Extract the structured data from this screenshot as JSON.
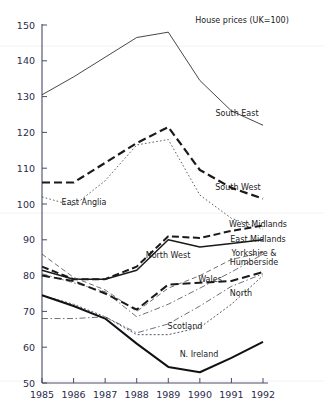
{
  "chart_data": {
    "type": "line",
    "title": "House prices (UK=100)",
    "xlabel": "",
    "ylabel": "",
    "x": [
      1985,
      1986,
      1987,
      1988,
      1989,
      1990,
      1991,
      1992
    ],
    "xticklabels": [
      "1985",
      "1986",
      "1987",
      "1988",
      "1989",
      "1990",
      "1991",
      "1992"
    ],
    "yticklabels": [
      "50",
      "60",
      "70",
      "80",
      "90",
      "100",
      "110",
      "120",
      "130",
      "140",
      "150"
    ],
    "ylim": [
      50,
      150
    ],
    "xlim": [
      1985,
      1992
    ],
    "grid": false,
    "legend_position": "inline-right",
    "series": [
      {
        "name": "South East",
        "label": "South East",
        "style": "solid-thin",
        "color": "#333333",
        "values": [
          130.5,
          135.5,
          141.0,
          146.5,
          148.0,
          134.5,
          126.0,
          122.0
        ]
      },
      {
        "name": "South West",
        "label": "South West",
        "style": "dashed-thick",
        "color": "#1a1a1a",
        "values": [
          106.0,
          106.0,
          111.5,
          117.0,
          121.5,
          109.5,
          104.5,
          101.5
        ]
      },
      {
        "name": "East Anglia",
        "label": "East Anglia",
        "style": "dotted",
        "color": "#444444",
        "values": [
          102.0,
          99.5,
          106.5,
          116.5,
          118.0,
          102.5,
          96.0,
          93.0
        ]
      },
      {
        "name": "West Midlands",
        "label": "West Midlands",
        "style": "dash-thick-med",
        "color": "#1a1a1a",
        "values": [
          82.5,
          79.0,
          79.0,
          82.5,
          91.0,
          90.5,
          92.5,
          94.0
        ]
      },
      {
        "name": "East Midlands",
        "label": "East Midlands",
        "style": "solid-med",
        "color": "#1a1a1a",
        "values": [
          81.5,
          79.0,
          79.0,
          81.5,
          90.0,
          88.0,
          89.0,
          90.0
        ]
      },
      {
        "name": "North West",
        "label": "North West",
        "style": "dashed-fine",
        "color": "#555555",
        "values": [
          86.0,
          79.5,
          76.0,
          70.0,
          76.5,
          80.0,
          84.5,
          86.5
        ]
      },
      {
        "name": "Yorkshire & Humberside",
        "label": "Yorkshire & Humberside",
        "style": "dash-dot",
        "color": "#555566",
        "values": [
          80.5,
          78.0,
          75.5,
          68.5,
          72.0,
          76.5,
          81.0,
          86.0
        ]
      },
      {
        "name": "Wales",
        "label": "Wales",
        "style": "dashed-thick-flat",
        "color": "#1a1a1a",
        "values": [
          80.0,
          78.5,
          75.0,
          70.5,
          77.5,
          78.0,
          78.5,
          81.0
        ]
      },
      {
        "name": "North",
        "label": "North",
        "style": "dash-dot-fine",
        "color": "#555566",
        "values": [
          68.0,
          68.0,
          68.5,
          64.0,
          66.5,
          71.5,
          77.0,
          80.5
        ]
      },
      {
        "name": "Scotland",
        "label": "Scotland",
        "style": "dotted-fine",
        "color": "#444455",
        "values": [
          74.5,
          72.0,
          68.5,
          63.5,
          63.5,
          65.5,
          72.0,
          80.0
        ]
      },
      {
        "name": "N. Ireland",
        "label": "N. Ireland",
        "style": "solid-thick",
        "color": "#111111",
        "values": [
          74.5,
          71.5,
          68.0,
          61.0,
          54.5,
          53.0,
          57.0,
          61.5
        ]
      }
    ],
    "annotations": [
      {
        "text": "South East",
        "x": 237,
        "y": 116
      },
      {
        "text": "South West",
        "x": 238,
        "y": 190
      },
      {
        "text": "East Anglia",
        "x": 84,
        "y": 205
      },
      {
        "text": "West Midlands",
        "x": 258,
        "y": 227
      },
      {
        "text": "East Midlands",
        "x": 258,
        "y": 242
      },
      {
        "text": "Yorkshire &",
        "x": 254,
        "y": 256
      },
      {
        "text": "Humberside",
        "x": 254,
        "y": 265
      },
      {
        "text": "North West",
        "x": 168,
        "y": 258
      },
      {
        "text": "Wales",
        "x": 210,
        "y": 282
      },
      {
        "text": "North",
        "x": 241,
        "y": 296
      },
      {
        "text": "Scotland",
        "x": 185,
        "y": 329
      },
      {
        "text": "N. Ireland",
        "x": 199,
        "y": 357
      }
    ]
  }
}
